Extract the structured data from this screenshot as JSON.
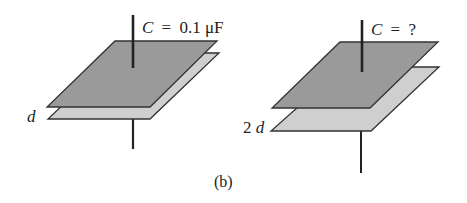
{
  "figure": {
    "panel_label": "(b)",
    "left_capacitor": {
      "capacitance_var": "C",
      "equals": "=",
      "capacitance_value": "0.1 μF",
      "separation_label": "d"
    },
    "right_capacitor": {
      "capacitance_var": "C",
      "equals": "=",
      "capacitance_value": "?",
      "separation_label": "2d"
    },
    "colors": {
      "top_plate": "#9a9a9a",
      "bottom_plate": "#cfcfcf",
      "outline": "#333333",
      "wire": "#222222"
    }
  }
}
